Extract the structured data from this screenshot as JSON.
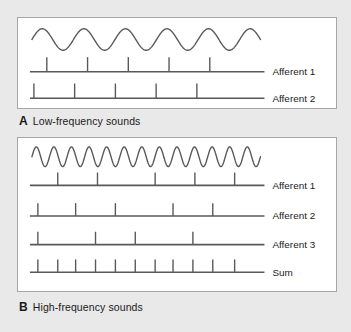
{
  "figure": {
    "background_color": "#e9e9e9",
    "panel_background": "#ffffff",
    "panel_border_color": "#a6a6a6",
    "stroke_color": "#595959"
  },
  "panels": [
    {
      "id": "panel-a",
      "caption_letter": "A",
      "caption_text": "Low-frequency sounds",
      "stimulus": {
        "name": "low-frequency-sine-wave",
        "cycles": 5.5,
        "amplitude": 11,
        "baseline_y": 22,
        "x_start": 14,
        "x_end": 244
      },
      "traces": [
        {
          "label": "Afferent 1",
          "baseline_y": 55,
          "line_x_start": 12,
          "line_x_end": 248,
          "spike_height": 15,
          "spikes": [
            29,
            70,
            111,
            152,
            193
          ]
        },
        {
          "label": "Afferent 2",
          "baseline_y": 82,
          "line_x_start": 12,
          "line_x_end": 248,
          "spike_height": 15,
          "spikes": [
            16,
            57,
            98,
            139,
            180
          ]
        }
      ]
    },
    {
      "id": "panel-b",
      "caption_letter": "B",
      "caption_text": "High-frequency sounds",
      "stimulus": {
        "name": "high-frequency-sine-wave",
        "cycles": 13,
        "amplitude": 10,
        "baseline_y": 19,
        "x_start": 14,
        "x_end": 244
      },
      "traces": [
        {
          "label": "Afferent 1",
          "baseline_y": 48,
          "line_x_start": 12,
          "line_x_end": 248,
          "spike_height": 13,
          "spikes": [
            40,
            80,
            138,
            178,
            218
          ]
        },
        {
          "label": "Afferent 2",
          "baseline_y": 79,
          "line_x_start": 12,
          "line_x_end": 248,
          "spike_height": 13,
          "spikes": [
            20,
            58,
            98,
            156,
            196
          ]
        },
        {
          "label": "Afferent 3",
          "baseline_y": 108,
          "line_x_start": 12,
          "line_x_end": 248,
          "spike_height": 13,
          "spikes": [
            20,
            78,
            118,
            176
          ]
        },
        {
          "label": "Sum",
          "baseline_y": 136,
          "line_x_start": 12,
          "line_x_end": 248,
          "spike_height": 13,
          "spikes": [
            20,
            40,
            58,
            78,
            98,
            118,
            138,
            156,
            176,
            196,
            218
          ]
        }
      ]
    }
  ],
  "chart_data": {
    "type": "line",
    "panels": [
      {
        "label": "A",
        "title": "Low-frequency sounds",
        "stimulus_cycles": 5.5,
        "series": [
          {
            "name": "Afferent 1",
            "spike_times": [
              29,
              70,
              111,
              152,
              193
            ],
            "spike_count": 5
          },
          {
            "name": "Afferent 2",
            "spike_times": [
              16,
              57,
              98,
              139,
              180
            ],
            "spike_count": 5
          }
        ]
      },
      {
        "label": "B",
        "title": "High-frequency sounds",
        "stimulus_cycles": 13,
        "series": [
          {
            "name": "Afferent 1",
            "spike_times": [
              40,
              80,
              138,
              178,
              218
            ],
            "spike_count": 5
          },
          {
            "name": "Afferent 2",
            "spike_times": [
              20,
              58,
              98,
              156,
              196
            ],
            "spike_count": 5
          },
          {
            "name": "Afferent 3",
            "spike_times": [
              20,
              78,
              118,
              176
            ],
            "spike_count": 4
          },
          {
            "name": "Sum",
            "spike_times": [
              20,
              40,
              58,
              78,
              98,
              118,
              138,
              156,
              176,
              196,
              218
            ],
            "spike_count": 11
          }
        ]
      }
    ]
  }
}
